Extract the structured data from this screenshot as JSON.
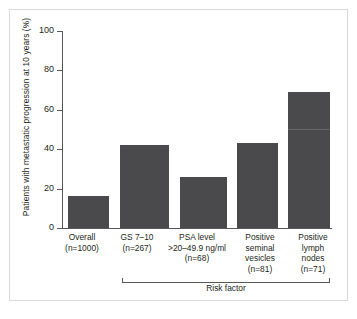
{
  "chart_data": {
    "type": "bar",
    "title": "",
    "xlabel": "Risk factor",
    "ylabel": "Patients with metastatic progression at 10 years (%)",
    "ylim": [
      0,
      100
    ],
    "yticks": [
      0,
      20,
      40,
      60,
      80,
      100
    ],
    "grid": false,
    "legend": null,
    "bar_color": "#4a4a4c",
    "categories": [
      "Overall\n(n=1000)",
      "GS 7–10\n(n=267)",
      "PSA level\n>20–49.9 ng/ml\n(n=68)",
      "Positive\nseminal\nvesicles\n(n=81)",
      "Positive\nlymph\nnodes\n(n=71)"
    ],
    "values": [
      16,
      42,
      26,
      43,
      69
    ],
    "bars": [
      {
        "label_lines": [
          "Overall",
          "(n=1000)"
        ],
        "group": "Overall",
        "n": 1000,
        "value": 16
      },
      {
        "label_lines": [
          "GS 7–10",
          "(n=267)"
        ],
        "group": "Risk factor",
        "n": 267,
        "value": 42
      },
      {
        "label_lines": [
          "PSA level",
          ">20–49.9 ng/ml",
          "(n=68)"
        ],
        "group": "Risk factor",
        "n": 68,
        "value": 26
      },
      {
        "label_lines": [
          "Positive",
          "seminal",
          "vesicles",
          "(n=81)"
        ],
        "group": "Risk factor",
        "n": 81,
        "value": 43
      },
      {
        "label_lines": [
          "Positive",
          "lymph",
          "nodes",
          "(n=71)"
        ],
        "group": "Risk factor",
        "n": 71,
        "value": 69
      }
    ],
    "ytick_labels": [
      "0",
      "20",
      "40",
      "60",
      "80",
      "100"
    ],
    "bracket_label": "Risk factor",
    "bracket_spans_categories": [
      1,
      2,
      3,
      4
    ]
  }
}
